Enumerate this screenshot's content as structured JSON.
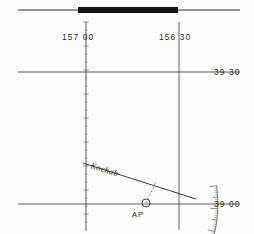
{
  "sheet": {
    "title": "Universal Plotting Sheet",
    "width": 254,
    "height": 234,
    "colors": {
      "ink": "#2b2b2b",
      "grid": "#4a4a4a",
      "bar": "#121212",
      "scale": "#6a6a6a",
      "paper": "#fdfdfb"
    }
  },
  "meridians": [
    {
      "name": "meridian-157-00",
      "label": "157 00",
      "x": 86,
      "label_x": 62,
      "label_y": 40
    },
    {
      "name": "meridian-156-30",
      "label": "156 30",
      "x": 179,
      "label_x": 159,
      "label_y": 40
    }
  ],
  "parallels": [
    {
      "name": "parallel-39-30",
      "label": "39 30",
      "y": 72,
      "label_x": 214,
      "label_y": 75
    },
    {
      "name": "parallel-39-00",
      "label": "39 00",
      "y": 204,
      "label_x": 214,
      "label_y": 207
    }
  ],
  "top_bar": {
    "label": "latitude-scale-bar",
    "x1": 78,
    "x2": 178,
    "y": 10,
    "thickness": 6,
    "lead_left_x": 18,
    "lead_right_x": 240
  },
  "protractor": {
    "label": "compass-rose-arc",
    "center_x": 86,
    "center_y": 204,
    "radius": 132,
    "start_angle_deg": 172,
    "end_angle_deg": 300,
    "scale_numbers": [
      {
        "value": "10",
        "angle": 272
      },
      {
        "value": "20",
        "angle": 282
      },
      {
        "value": "30",
        "angle": 292
      },
      {
        "value": "40",
        "angle": 302
      },
      {
        "value": "50",
        "angle": 312
      },
      {
        "value": "60",
        "angle": 322
      },
      {
        "value": "70",
        "angle": 332
      },
      {
        "value": "80",
        "angle": 342
      },
      {
        "value": "90",
        "angle": 352
      },
      {
        "value": "100",
        "angle": 2
      },
      {
        "value": "110",
        "angle": 12
      },
      {
        "value": "120",
        "angle": 22
      },
      {
        "value": "130",
        "angle": 32
      },
      {
        "value": "140",
        "angle": 42
      },
      {
        "value": "150",
        "angle": 52
      }
    ]
  },
  "plot": {
    "lop": {
      "label": "Kochab",
      "name": "line-of-position-kochab",
      "x1": 83,
      "y1": 163,
      "x2": 196,
      "y2": 199,
      "label_x": 90,
      "label_y": 168
    },
    "assumed_position": {
      "label": "AP",
      "name": "assumed-position-marker",
      "x": 146,
      "y": 203,
      "radius": 4,
      "label_x": 132,
      "label_y": 217
    },
    "intercept": {
      "name": "intercept-line",
      "x1": 146,
      "y1": 203,
      "x2": 156,
      "y2": 182
    }
  },
  "vertical_ticks": {
    "name": "meridian-minute-ticks",
    "meridian_x": 86,
    "top": 22,
    "bottom": 230,
    "spacing": 8
  }
}
